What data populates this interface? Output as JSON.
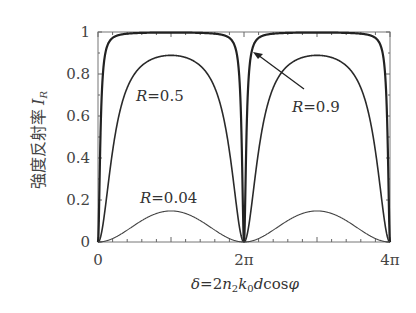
{
  "chart_data": {
    "type": "line",
    "title": "",
    "xlabel": "δ=2n₂k₀dcosφ",
    "ylabel": "強度反射率 I_R",
    "ylabel_text": "強度反射率",
    "ylabel_symbol": "I",
    "ylabel_sub": "R",
    "xlim": [
      0,
      12.566
    ],
    "ylim": [
      0,
      1
    ],
    "x_ticks": [
      {
        "value": 0,
        "label": "0"
      },
      {
        "value": 6.283,
        "label": "2π"
      },
      {
        "value": 12.566,
        "label": "4π"
      }
    ],
    "y_ticks": [
      {
        "value": 0,
        "label": "0"
      },
      {
        "value": 0.2,
        "label": "0.2"
      },
      {
        "value": 0.4,
        "label": "0.4"
      },
      {
        "value": 0.6,
        "label": "0.6"
      },
      {
        "value": 0.8,
        "label": "0.8"
      },
      {
        "value": 1,
        "label": "1"
      }
    ],
    "grid": false,
    "legend": "none (inline annotations)",
    "formula": "I_R = F sin²(δ/2) / (1 + F sin²(δ/2)), F = 4R/(1−R)²",
    "series": [
      {
        "name": "R=0.9",
        "R": 0.9,
        "peak": 0.997,
        "x": [
          0,
          0.5,
          1,
          2,
          3.14,
          4.28,
          5.28,
          5.78,
          6.283,
          6.78,
          7.28,
          8.28,
          9.42,
          10.56,
          11.56,
          12.07,
          12.566
        ],
        "values": [
          0,
          0.957,
          0.988,
          0.996,
          0.997,
          0.996,
          0.988,
          0.957,
          0,
          0.957,
          0.988,
          0.996,
          0.997,
          0.996,
          0.988,
          0.957,
          0
        ]
      },
      {
        "name": "R=0.5",
        "R": 0.5,
        "peak": 0.889,
        "x": [
          0,
          0.5,
          1,
          2,
          3.14,
          4.28,
          5.28,
          5.78,
          6.283,
          6.78,
          7.28,
          8.28,
          9.42,
          10.56,
          11.56,
          12.07,
          12.566
        ],
        "values": [
          0,
          0.33,
          0.639,
          0.835,
          0.889,
          0.835,
          0.639,
          0.33,
          0,
          0.33,
          0.639,
          0.835,
          0.889,
          0.835,
          0.639,
          0.33,
          0
        ]
      },
      {
        "name": "R=0.04",
        "R": 0.04,
        "peak": 0.148,
        "x": [
          0,
          1,
          2,
          3.14,
          4.28,
          5.28,
          6.283,
          7.28,
          8.28,
          9.42,
          10.56,
          11.56,
          12.566
        ],
        "values": [
          0,
          0.039,
          0.112,
          0.148,
          0.112,
          0.039,
          0,
          0.039,
          0.112,
          0.148,
          0.112,
          0.039,
          0
        ]
      }
    ],
    "annotations": [
      {
        "text": "R=0.5",
        "near_series": "R=0.5"
      },
      {
        "text": "R=0.9",
        "near_series": "R=0.9",
        "arrow": true
      },
      {
        "text": "R=0.04",
        "near_series": "R=0.04"
      }
    ]
  },
  "labels": {
    "ann_r05_sym": "R",
    "ann_r05_val": "=0.5",
    "ann_r09_sym": "R",
    "ann_r09_val": "=0.9",
    "ann_r004_sym": "R",
    "ann_r004_val": "=0.04",
    "x_delta": "δ",
    "x_eq": "=2",
    "x_n": "n",
    "x_n_sub": "2",
    "x_k": "k",
    "x_k_sub": "0",
    "x_d": "d",
    "x_cos": "cos",
    "x_phi": "φ"
  }
}
